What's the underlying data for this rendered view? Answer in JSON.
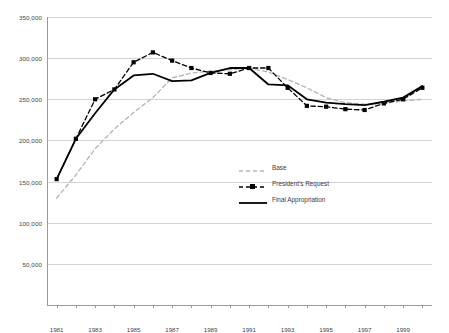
{
  "chart_data": {
    "type": "line",
    "title": "",
    "xlabel": "",
    "ylabel": "",
    "xlim": [
      1980.5,
      2000.5
    ],
    "ylim": [
      0,
      350000
    ],
    "grid": true,
    "legend_position": "center-left-inside",
    "y_ticks": [
      0,
      50000,
      100000,
      150000,
      200000,
      250000,
      300000,
      350000
    ],
    "y_tick_labels": [
      "",
      "50,000",
      "100,000",
      "150,000",
      "200,000",
      "250,000",
      "300,000",
      "350,000"
    ],
    "x": [
      1981,
      1982,
      1983,
      1984,
      1985,
      1986,
      1987,
      1988,
      1989,
      1990,
      1991,
      1992,
      1993,
      1994,
      1995,
      1996,
      1997,
      1998,
      1999,
      2000
    ],
    "x_tick_labels": [
      "1981",
      "",
      "1983",
      "",
      "1985",
      "",
      "1987",
      "",
      "1989",
      "",
      "1991",
      "",
      "1993",
      "",
      "1995",
      "",
      "1997",
      "",
      "1999",
      ""
    ],
    "series": [
      {
        "name": "Base",
        "style": "dashed",
        "color": "#b4b4b4",
        "marker": "none",
        "values": [
          130000,
          158000,
          190000,
          214000,
          234000,
          252000,
          276000,
          282000,
          284000,
          286000,
          288000,
          283000,
          274000,
          264000,
          252000,
          246000,
          244000,
          245000,
          248000,
          250000
        ]
      },
      {
        "name": "President's Request",
        "style": "dashed",
        "color": "#000000",
        "marker": "square",
        "values": [
          153000,
          202000,
          250000,
          262000,
          295000,
          307000,
          297000,
          288000,
          282000,
          281000,
          288000,
          288000,
          264000,
          242000,
          241000,
          238000,
          237000,
          245000,
          250000,
          264000
        ]
      },
      {
        "name": "Final Appropriation",
        "style": "solid",
        "color": "#000000",
        "marker": "none",
        "values": [
          153000,
          202000,
          233000,
          262000,
          279000,
          281000,
          272000,
          273000,
          282000,
          288000,
          288000,
          268000,
          267000,
          250000,
          246000,
          244000,
          243000,
          247000,
          252000,
          266000
        ]
      }
    ],
    "legend_entries": [
      {
        "label": "Base"
      },
      {
        "label": "President's Request"
      },
      {
        "label": "Final Appropriation"
      }
    ]
  }
}
